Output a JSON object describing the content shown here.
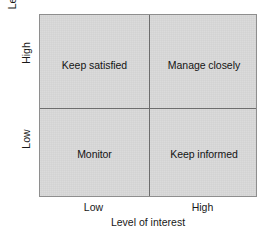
{
  "chart_data": {
    "type": "table",
    "title": "",
    "xlabel": "Level of interest",
    "ylabel": "Level of influence (power)",
    "x_ticks": [
      "Low",
      "High"
    ],
    "y_ticks": [
      "Low",
      "High"
    ],
    "grid": true,
    "legend": "none",
    "quadrants": [
      {
        "x": "Low",
        "y": "High",
        "label": "Keep satisfied"
      },
      {
        "x": "High",
        "y": "High",
        "label": "Manage closely"
      },
      {
        "x": "Low",
        "y": "Low",
        "label": "Monitor"
      },
      {
        "x": "High",
        "y": "Low",
        "label": "Keep informed"
      }
    ]
  },
  "axes": {
    "y": {
      "title": "Level of influence (power)",
      "tick_high": "High",
      "tick_low": "Low"
    },
    "x": {
      "title": "Level of interest",
      "tick_low": "Low",
      "tick_high": "High"
    }
  },
  "quadrants": {
    "top_left": "Keep satisfied",
    "top_right": "Manage closely",
    "bottom_left": "Monitor",
    "bottom_right": "Keep informed"
  },
  "colors": {
    "plot_fill": "#d7d7d7",
    "plot_border": "#8e8e8e",
    "divider": "#6d6d6d",
    "text": "#141414",
    "background": "#ffffff"
  }
}
